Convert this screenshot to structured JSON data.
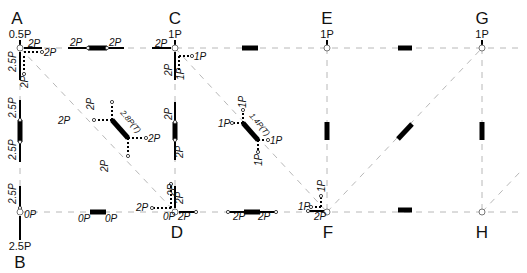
{
  "diagram": {
    "type": "truss free-body force diagram",
    "joints": {
      "A": {
        "label": "A",
        "load": "0.5P"
      },
      "B": {
        "label": "B",
        "reaction": "2.5P"
      },
      "C": {
        "label": "C",
        "load": "1P"
      },
      "D": {
        "label": "D"
      },
      "E": {
        "label": "E",
        "load": "1P"
      },
      "F": {
        "label": "F"
      },
      "G": {
        "label": "G",
        "load": "1P"
      },
      "H": {
        "label": "H"
      }
    },
    "member_forces": {
      "AC_left": "2P",
      "AC_right": "2P",
      "A_top": "2P",
      "A_right": "2P",
      "A_down_solid": "2.5P",
      "A_down_dot": "2P",
      "AB_top": "2.5P",
      "AB_bottom": "2.5P",
      "B_top": "2.5P",
      "B_right": "0P",
      "BD_left": "0P",
      "BD_right": "0P",
      "AD_diag_label": "2.8P(T)",
      "AD_top": "2P",
      "AD_left": "2P",
      "AD_right": "2P",
      "AD_bottom": "2P",
      "C_left": "2P",
      "C_down_solid": "2P",
      "C_down_dot": "1P",
      "C_right": "1P",
      "CD_top": "2P",
      "CD_bottom": "2P",
      "D_top_dot": "2P",
      "D_top_solid": "2P",
      "D_left": "2P",
      "D_zero": "0P",
      "D_right": "2P",
      "DF_left": "2P",
      "DF_right": "2P",
      "CF_diag_label": "1.4P(T)",
      "CF_top": "1P",
      "CF_left": "1P",
      "CF_right": "1P",
      "CF_bottom": "1P",
      "F_up": "1P",
      "F_left": "1P",
      "F_bottom": "2P"
    },
    "accent_color": "#000000",
    "guide_color": "#b8b8b8"
  }
}
